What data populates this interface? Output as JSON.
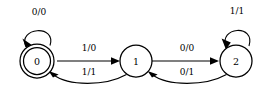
{
  "diagram": {
    "type": "finite-state-machine",
    "background_color": "#ffffff",
    "stroke_color": "#000000",
    "states": [
      {
        "id": "0",
        "label": "0",
        "accepting": true,
        "shape": "double-circle",
        "cx": 37,
        "cy": 61,
        "r": 17
      },
      {
        "id": "1",
        "label": "1",
        "accepting": false,
        "shape": "circle",
        "cx": 136,
        "cy": 61,
        "r": 16
      },
      {
        "id": "2",
        "label": "2",
        "accepting": false,
        "shape": "circle",
        "cx": 236,
        "cy": 61,
        "r": 16
      }
    ],
    "transitions": [
      {
        "id": "t-0-0",
        "from": "0",
        "to": "0",
        "input": "0",
        "output": "0",
        "label": "0/0",
        "kind": "self-loop",
        "label_x": 39,
        "label_y": 12
      },
      {
        "id": "t-0-1",
        "from": "0",
        "to": "1",
        "input": "1",
        "output": "0",
        "label": "1/0",
        "kind": "straight",
        "label_x": 89,
        "label_y": 48
      },
      {
        "id": "t-1-0",
        "from": "1",
        "to": "0",
        "input": "1",
        "output": "1",
        "label": "1/1",
        "kind": "curve",
        "label_x": 89,
        "label_y": 72
      },
      {
        "id": "t-1-2",
        "from": "1",
        "to": "2",
        "input": "0",
        "output": "0",
        "label": "0/0",
        "kind": "straight",
        "label_x": 187,
        "label_y": 48
      },
      {
        "id": "t-2-1",
        "from": "2",
        "to": "1",
        "input": "0",
        "output": "1",
        "label": "0/1",
        "kind": "curve",
        "label_x": 187,
        "label_y": 72
      },
      {
        "id": "t-2-2",
        "from": "2",
        "to": "2",
        "input": "1",
        "output": "1",
        "label": "1/1",
        "kind": "self-loop",
        "label_x": 237,
        "label_y": 11
      }
    ]
  }
}
